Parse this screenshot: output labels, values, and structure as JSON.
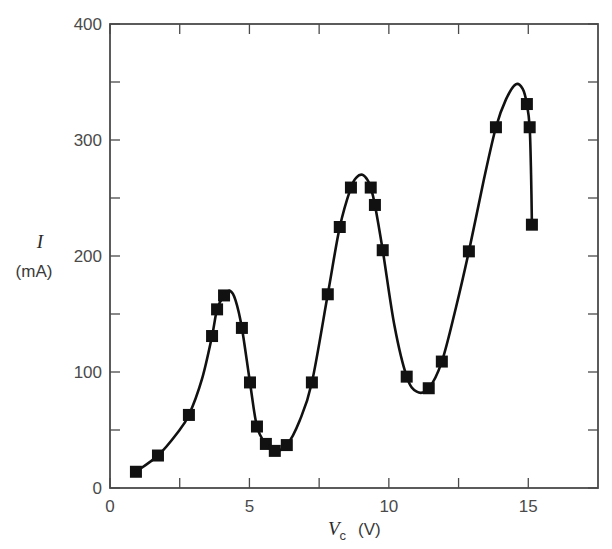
{
  "chart_data": {
    "type": "scatter",
    "title": "",
    "xlabel": "V_c (V)",
    "xlabel_var": "V",
    "xlabel_sub": "c",
    "xlabel_unit": "(V)",
    "ylabel": "I (mA)",
    "ylabel_var": "I",
    "ylabel_unit": "(mA)",
    "xlim": [
      0,
      17.5
    ],
    "ylim": [
      0,
      400
    ],
    "x_ticks": [
      0,
      5,
      10,
      15
    ],
    "x_tick_labels": [
      "0",
      "5",
      "10",
      "15"
    ],
    "x_minor_ticks": [
      2.5,
      7.5,
      12.5
    ],
    "y_ticks": [
      0,
      100,
      200,
      300,
      400
    ],
    "y_tick_labels": [
      "0",
      "100",
      "200",
      "300",
      "400"
    ],
    "y_minor_ticks": [
      50,
      150,
      250,
      350
    ],
    "grid": false,
    "legend": null,
    "marker": "filled-square",
    "fit_curve": "smooth line through data showing three current peaks",
    "series": [
      {
        "name": "measured",
        "x": [
          0.93,
          1.72,
          2.83,
          3.66,
          3.84,
          4.09,
          4.73,
          5.02,
          5.27,
          5.59,
          5.91,
          6.34,
          7.24,
          7.81,
          8.24,
          8.64,
          9.35,
          9.5,
          9.78,
          10.64,
          11.43,
          11.9,
          12.87,
          13.84,
          14.95,
          15.05,
          15.13
        ],
        "y": [
          14,
          28,
          63,
          131,
          154,
          166,
          138,
          91,
          53,
          38,
          32,
          37,
          91,
          167,
          225,
          259,
          259,
          244,
          205,
          96,
          86,
          109,
          204,
          311,
          331,
          311,
          227
        ]
      }
    ],
    "curve": {
      "x": [
        0.93,
        1.72,
        2.4,
        2.83,
        3.3,
        3.66,
        3.84,
        4.09,
        4.3,
        4.5,
        4.73,
        5.02,
        5.27,
        5.59,
        5.91,
        6.34,
        6.8,
        7.24,
        7.81,
        8.24,
        8.64,
        8.85,
        9.05,
        9.25,
        9.35,
        9.5,
        9.78,
        10.2,
        10.64,
        11.0,
        11.43,
        11.9,
        12.4,
        12.87,
        13.4,
        13.84,
        14.2,
        14.55,
        14.8,
        14.95,
        15.05,
        15.1,
        15.13
      ],
      "y": [
        14,
        28,
        47,
        63,
        94,
        131,
        154,
        166,
        170,
        162,
        138,
        91,
        53,
        38,
        32,
        37,
        58,
        91,
        167,
        225,
        259,
        268,
        270,
        265,
        259,
        244,
        205,
        140,
        96,
        83,
        86,
        109,
        155,
        204,
        265,
        311,
        335,
        348,
        344,
        331,
        311,
        270,
        227
      ]
    },
    "annotations": []
  },
  "plot_area_px": {
    "left": 110,
    "right": 598,
    "top": 24,
    "bottom": 488
  },
  "colors": {
    "frame": "#4a4a4a",
    "marker": "#111111",
    "curve": "#111111",
    "text": "#4a4a4a"
  }
}
